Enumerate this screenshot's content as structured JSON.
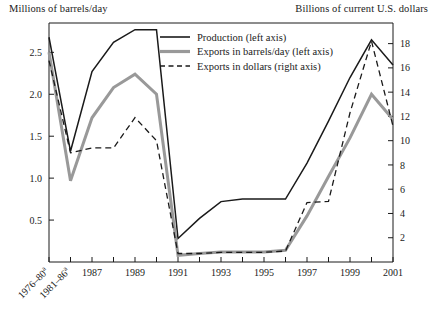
{
  "chart_data": {
    "type": "line",
    "title": "",
    "xlabel": "",
    "ylabel": "Millions of barrels/day",
    "y2label": "Billions of current U.S. dollars",
    "grid": false,
    "legend_position": "top-center",
    "ylim": [
      0,
      2.85
    ],
    "y2lim": [
      0,
      19.7
    ],
    "yticks": [
      "0.5",
      "1.0",
      "1.5",
      "2.0",
      "2.5"
    ],
    "ytick_values": [
      0.5,
      1.0,
      1.5,
      2.0,
      2.5
    ],
    "y2ticks": [
      "2",
      "4",
      "6",
      "8",
      "10",
      "12",
      "14",
      "16",
      "18"
    ],
    "y2tick_values": [
      2,
      4,
      6,
      8,
      10,
      12,
      14,
      16,
      18
    ],
    "categories": [
      "1976–80a",
      "1981–86a",
      "1987",
      "1988",
      "1989",
      "1990",
      "1991",
      "1992",
      "1993",
      "1994",
      "1995",
      "1996",
      "1997",
      "1998",
      "1999",
      "2000",
      "2001"
    ],
    "xtick_labels": [
      "1976–80a",
      "1981–86a",
      "1987",
      "1989",
      "1991",
      "1993",
      "1995",
      "1997",
      "1999",
      "2001"
    ],
    "xtick_label_indices": [
      0,
      1,
      2,
      4,
      6,
      8,
      10,
      12,
      14,
      16
    ],
    "series": [
      {
        "name": "Production (left axis)",
        "axis": "left",
        "style": "solid",
        "color": "#1a1a1a",
        "width": 1.5,
        "values": [
          2.68,
          1.32,
          2.27,
          2.62,
          2.77,
          2.77,
          0.28,
          0.52,
          0.72,
          0.75,
          0.75,
          0.75,
          1.18,
          1.68,
          2.2,
          2.65,
          2.35
        ]
      },
      {
        "name": "Exports in barrels/day (left axis)",
        "axis": "left",
        "style": "solid",
        "color": "#999999",
        "width": 3.0,
        "values": [
          2.5,
          0.97,
          1.72,
          2.08,
          2.24,
          2.0,
          0.08,
          0.1,
          0.12,
          0.12,
          0.12,
          0.14,
          0.55,
          1.02,
          1.48,
          2.0,
          1.7
        ]
      },
      {
        "name": "Exports in dollars (right axis)",
        "axis": "right",
        "style": "dashed",
        "color": "#1a1a1a",
        "width": 1.3,
        "values": [
          16.6,
          9.0,
          9.4,
          9.4,
          11.9,
          10.0,
          0.7,
          0.7,
          0.8,
          0.8,
          0.8,
          0.9,
          4.9,
          5.0,
          12.3,
          18.2,
          11.2
        ]
      }
    ],
    "legend": [
      {
        "label": "Production (left axis)",
        "style": "solid",
        "color": "#1a1a1a",
        "width": 1.6
      },
      {
        "label": "Exports in barrels/day (left axis)",
        "style": "solid",
        "color": "#999999",
        "width": 3.2
      },
      {
        "label": "Exports in dollars (right axis)",
        "style": "dashed",
        "color": "#1a1a1a",
        "width": 1.3
      }
    ]
  }
}
